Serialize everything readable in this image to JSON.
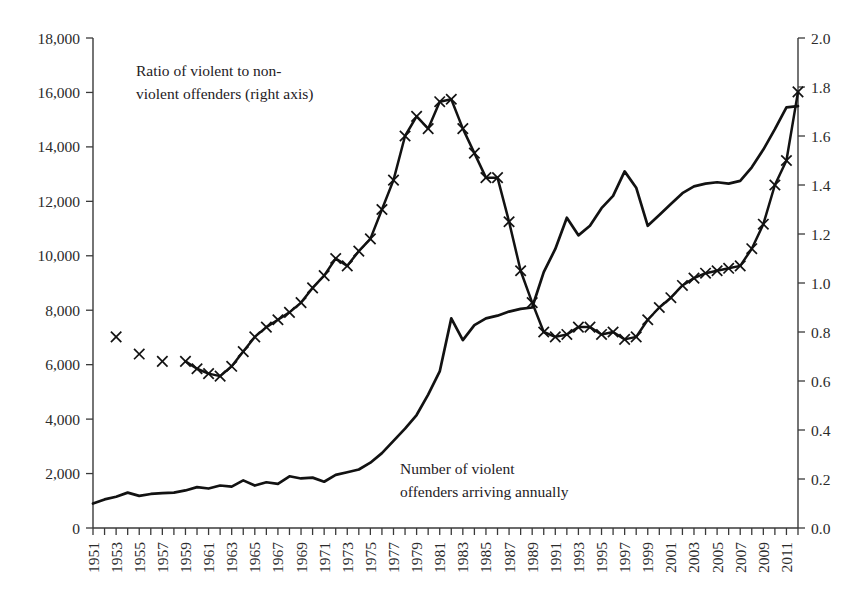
{
  "figure": {
    "background": "#ffffff",
    "ink_color": "#121212"
  },
  "annotations": {
    "ratio_label_line1": "Ratio of violent to non-",
    "ratio_label_line2": "violent offenders (right axis)",
    "count_label_line1": "Number of violent",
    "count_label_line2": "offenders arriving annually"
  },
  "chart_data": {
    "type": "line",
    "title": "",
    "subtitle": "",
    "xlabel": "",
    "ylabel": "",
    "grid": false,
    "legend_position": "inline-annotation",
    "x": [
      1951,
      1952,
      1953,
      1954,
      1955,
      1956,
      1957,
      1958,
      1959,
      1960,
      1961,
      1962,
      1963,
      1964,
      1965,
      1966,
      1967,
      1968,
      1969,
      1970,
      1971,
      1972,
      1973,
      1974,
      1975,
      1976,
      1977,
      1978,
      1979,
      1980,
      1981,
      1982,
      1983,
      1984,
      1985,
      1986,
      1987,
      1988,
      1989,
      1990,
      1991,
      1992,
      1993,
      1994,
      1995,
      1996,
      1997,
      1998,
      1999,
      2000,
      2001,
      2002,
      2003,
      2004,
      2005,
      2006,
      2007,
      2008,
      2009,
      2010,
      2011,
      2012
    ],
    "xlim": [
      1951,
      2012
    ],
    "xtick_labels": [
      "1951",
      "1953",
      "1955",
      "1957",
      "1959",
      "1961",
      "1963",
      "1965",
      "1967",
      "1969",
      "1971",
      "1973",
      "1975",
      "1977",
      "1979",
      "1981",
      "1983",
      "1985",
      "1987",
      "1989",
      "1991",
      "1993",
      "1995",
      "1997",
      "1999",
      "2001",
      "2003",
      "2005",
      "2007",
      "2009",
      "2011"
    ],
    "xtick_rotation": 90,
    "axes": [
      {
        "side": "left",
        "label": "",
        "ylim": [
          0,
          18000
        ],
        "ytick_values": [
          0,
          2000,
          4000,
          6000,
          8000,
          10000,
          12000,
          14000,
          16000,
          18000
        ],
        "ytick_labels": [
          "0",
          "2,000",
          "4,000",
          "6,000",
          "8,000",
          "10,000",
          "12,000",
          "14,000",
          "16,000",
          "18,000"
        ]
      },
      {
        "side": "right",
        "label": "",
        "ylim": [
          0,
          2.0
        ],
        "ytick_values": [
          0.0,
          0.2,
          0.4,
          0.6,
          0.8,
          1.0,
          1.2,
          1.4,
          1.6,
          1.8,
          2.0
        ],
        "ytick_labels": [
          "0.0",
          "0.2",
          "0.4",
          "0.6",
          "0.8",
          "1.0",
          "1.2",
          "1.4",
          "1.6",
          "1.8",
          "2.0"
        ]
      }
    ],
    "series": [
      {
        "name": "Number of violent offenders arriving annually",
        "axis": "left",
        "marker": "none",
        "values": [
          900,
          1050,
          1150,
          1300,
          1180,
          1250,
          1280,
          1300,
          1380,
          1500,
          1450,
          1560,
          1520,
          1750,
          1560,
          1680,
          1620,
          1900,
          1820,
          1850,
          1700,
          1950,
          2050,
          2150,
          2400,
          2750,
          3200,
          3650,
          4150,
          4900,
          5750,
          7700,
          6900,
          7450,
          7700,
          7800,
          7950,
          8050,
          8100,
          9400,
          10250,
          11400,
          10750,
          11100,
          11750,
          12200,
          13100,
          12500,
          11100,
          11500,
          11900,
          12300,
          12550,
          12650,
          12700,
          12650,
          12750,
          13250,
          13900,
          14650,
          15450,
          15500
        ]
      },
      {
        "name": "Ratio of violent to non-violent offenders",
        "axis": "right",
        "marker": "x",
        "connected_from": 1959,
        "values": [
          null,
          null,
          0.78,
          null,
          0.71,
          null,
          0.68,
          null,
          0.68,
          0.65,
          0.63,
          0.62,
          0.66,
          0.72,
          0.78,
          0.82,
          0.85,
          0.88,
          0.92,
          0.98,
          1.03,
          1.1,
          1.07,
          1.13,
          1.18,
          1.3,
          1.42,
          1.6,
          1.68,
          1.63,
          1.74,
          1.75,
          1.63,
          1.53,
          1.43,
          1.43,
          1.25,
          1.05,
          0.92,
          0.8,
          0.78,
          0.79,
          0.82,
          0.82,
          0.79,
          0.8,
          0.77,
          0.78,
          0.85,
          0.9,
          0.94,
          0.99,
          1.02,
          1.04,
          1.05,
          1.06,
          1.07,
          1.14,
          1.24,
          1.4,
          1.5,
          1.78
        ]
      }
    ]
  }
}
